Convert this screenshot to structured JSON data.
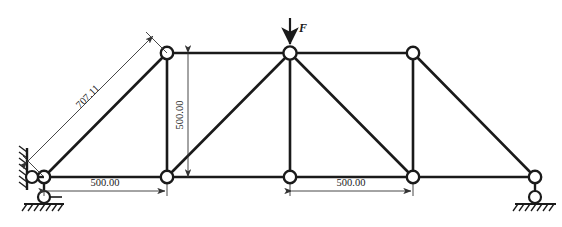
{
  "figure": {
    "type": "truss-structural-diagram",
    "stroke_color": "#1a1a1a",
    "dim_color": "#333333",
    "background": "#ffffff"
  },
  "load": {
    "label": "F",
    "direction": "down",
    "applied_at": "apex-joint"
  },
  "dimensions": {
    "diagonal_left": "707.11",
    "vertical_height": "500.00",
    "bottom_left_span": "500.00",
    "bottom_right_span": "500.00"
  },
  "supports": {
    "left": "wall-link-and-ground-pin",
    "right": "vertical-link-ground-pin"
  },
  "watermark": {
    "text": ""
  },
  "geometry": {
    "bottom_chord_y": 177,
    "top_chord_y": 53,
    "joints_bottom_x": [
      44,
      167,
      290,
      413,
      535
    ],
    "joints_top_x": [
      167,
      290,
      413
    ],
    "joint_radius": 6.2
  }
}
